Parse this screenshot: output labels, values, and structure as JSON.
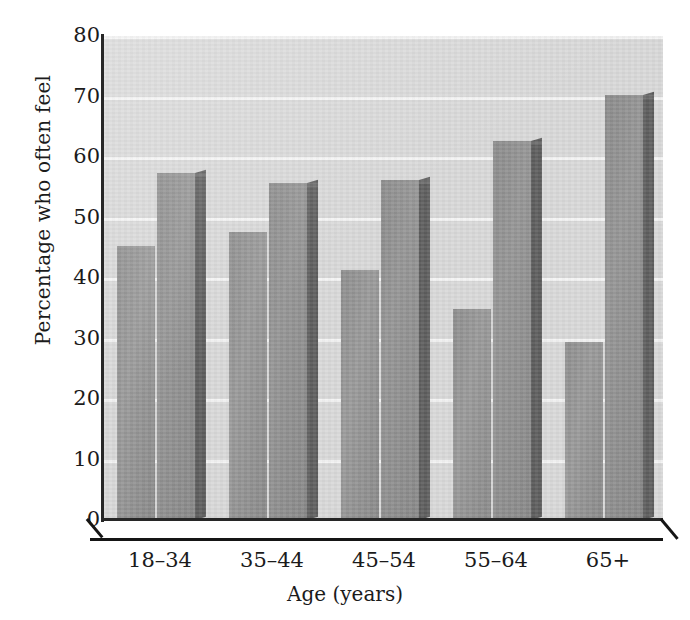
{
  "chart_data": {
    "type": "bar",
    "title": "",
    "subtitle": "",
    "xlabel": "Age (years)",
    "ylabel": "Percentage who often feel",
    "categories": [
      "18–34",
      "35–44",
      "45–54",
      "55–64",
      "65+"
    ],
    "series": [
      {
        "name": "Series 1",
        "values": [
          45.3,
          47.6,
          41.3,
          34.8,
          29.5
        ]
      },
      {
        "name": "Series 2",
        "values": [
          57.4,
          55.7,
          56.2,
          62.6,
          70.2
        ]
      }
    ],
    "ylim": [
      0,
      80
    ],
    "ytick_labels": [
      "0",
      "10",
      "20",
      "30",
      "40",
      "50",
      "60",
      "70",
      "80"
    ],
    "ytick_values": [
      0,
      10,
      20,
      30,
      40,
      50,
      60,
      70,
      80
    ],
    "ytick_interval": 10,
    "grid": true,
    "grid_orientation": "horizontal",
    "grid_color": "#f4f4f4",
    "legend": false,
    "legend_position": "none",
    "style": "3d-grouped-bar",
    "plot_background_color": "#d9d9d9",
    "bar_colors": [
      "#949494",
      "#919191"
    ],
    "bar_side_color": "#5e5e5e",
    "axis_color": "#1d1d1d",
    "annotations": []
  }
}
